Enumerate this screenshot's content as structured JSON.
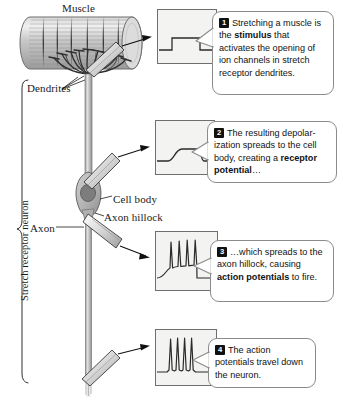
{
  "figure": {
    "type": "biology-diagram"
  },
  "diagram": {
    "labels": {
      "muscle": "Muscle",
      "dendrites": "Dendrites",
      "cell_body": "Cell body",
      "axon_hillock": "Axon hillock",
      "axon": "Axon",
      "stretch_receptor_neuron": "Stretch receptor neuron"
    }
  },
  "callouts": [
    {
      "number": "1",
      "lead": "Stretching a muscle is the ",
      "bold": "stimulus",
      "tail": " that activates the opening of ion channels in stretch receptor dendrites.",
      "trace": "square-pulse",
      "trace_name": "stimulus-trace"
    },
    {
      "number": "2",
      "lead": "The resulting depolar­ization spreads to the cell body, creating a ",
      "bold": "receptor potential",
      "tail": "…",
      "trace": "graded-depolarization",
      "trace_name": "receptor-potential-trace"
    },
    {
      "number": "3",
      "lead": "…which spreads to the axon hillock, causing ",
      "bold": "action potentials",
      "tail": " to fire.",
      "trace": "ramp-with-spikes",
      "trace_name": "axon-hillock-trace"
    },
    {
      "number": "4",
      "lead": "The action potentials travel down the neuron.",
      "bold": "",
      "tail": "",
      "trace": "spike-train",
      "trace_name": "axon-spike-trace"
    }
  ],
  "colors": {
    "muscle_fill": "#c9c9c9",
    "neuron_fill": "#b5b5b5",
    "nucleus_fill": "#7d7d7d",
    "trace_bg": "#f3f3f1",
    "trace_line": "#2b2b2b",
    "outline": "#4a4a4a",
    "badge_bg": "#111111",
    "callout_border": "#8b8b8b"
  }
}
